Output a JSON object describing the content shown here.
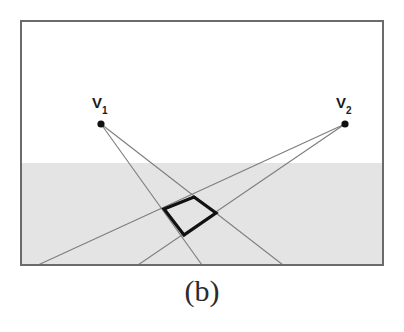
{
  "figure": {
    "caption": "(b)",
    "frame": {
      "x": 21,
      "y": 21,
      "width": 362,
      "height": 244,
      "stroke": "#6b6b6b",
      "stroke_width": 2,
      "fill": "#ffffff"
    },
    "ground_plane": {
      "label": "shaded ground region",
      "horizon_y": 163,
      "fill": "#e4e4e4"
    },
    "vanishing_points": [
      {
        "id": "v1",
        "label_main": "V",
        "label_sub": "1",
        "x": 101,
        "y": 124,
        "dot_radius": 3.6,
        "dot_color": "#111111"
      },
      {
        "id": "v2",
        "label_main": "V",
        "label_sub": "2",
        "x": 345,
        "y": 124,
        "dot_radius": 3.6,
        "dot_color": "#111111"
      }
    ],
    "perspective_lines": {
      "stroke": "#7d7d7d",
      "stroke_width": 1.1,
      "lines": [
        {
          "id": "v1-line-a",
          "from": "v1",
          "x1": 101,
          "y1": 124,
          "x2": 202,
          "y2": 265
        },
        {
          "id": "v1-line-b",
          "from": "v1",
          "x1": 101,
          "y1": 124,
          "x2": 283,
          "y2": 265
        },
        {
          "id": "v2-line-a",
          "from": "v2",
          "x1": 345,
          "y1": 124,
          "x2": 138,
          "y2": 265
        },
        {
          "id": "v2-line-b",
          "from": "v2",
          "x1": 345,
          "y1": 124,
          "x2": 38,
          "y2": 265
        }
      ]
    },
    "quadrilateral": {
      "id": "ground-quad",
      "stroke": "#111111",
      "stroke_width": 3.2,
      "fill": "none",
      "points": "194,197 216,213 184,235 164,209",
      "vertices": [
        {
          "name": "top",
          "x": 194,
          "y": 197
        },
        {
          "name": "right",
          "x": 216,
          "y": 213
        },
        {
          "name": "bottom",
          "x": 184,
          "y": 235
        },
        {
          "name": "left",
          "x": 164,
          "y": 209
        }
      ]
    }
  }
}
